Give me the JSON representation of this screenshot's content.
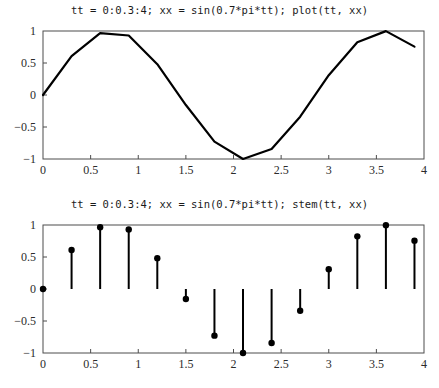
{
  "figure": {
    "background": "#ffffff",
    "line_color": "#000000",
    "axis_color": "#4d4d4d",
    "tick_label_color": "#2b2b2b"
  },
  "panels": [
    {
      "name": "line-plot",
      "title": "tt = 0:0.3:4; xx = sin(0.7*pi*tt); plot(tt, xx)"
    },
    {
      "name": "stem-plot",
      "title": "tt = 0:0.3:4; xx = sin(0.7*pi*tt); stem(tt, xx)"
    }
  ],
  "chart_data": [
    {
      "type": "line",
      "title": "tt = 0:0.3:4; xx = sin(0.7*pi*tt); plot(tt, xx)",
      "xlabel": "",
      "ylabel": "",
      "xlim": [
        0,
        4
      ],
      "ylim": [
        -1,
        1
      ],
      "xticks": [
        0,
        0.5,
        1,
        1.5,
        2,
        2.5,
        3,
        3.5,
        4
      ],
      "xtick_labels": [
        "0",
        "0.5",
        "1",
        "1.5",
        "2",
        "2.5",
        "3",
        "3.5",
        "4"
      ],
      "yticks": [
        -1,
        -0.5,
        0,
        0.5,
        1
      ],
      "ytick_labels": [
        "−1",
        "−0.5",
        "0",
        "0.5",
        "1"
      ],
      "grid": false,
      "legend": null,
      "x": [
        0,
        0.3,
        0.6,
        0.9,
        1.2,
        1.5,
        1.8,
        2.1,
        2.4,
        2.7,
        3.0,
        3.3,
        3.6,
        3.9
      ],
      "values": [
        0.0,
        0.6088,
        0.9659,
        0.9298,
        0.4818,
        -0.1564,
        -0.729,
        -1.0,
        -0.8443,
        -0.3387,
        0.309,
        0.823,
        0.998,
        0.7557
      ],
      "series": [
        {
          "name": "xx = sin(0.7*pi*tt)",
          "values": [
            0.0,
            0.6088,
            0.9659,
            0.9298,
            0.4818,
            -0.1564,
            -0.729,
            -1.0,
            -0.8443,
            -0.3387,
            0.309,
            0.823,
            0.998,
            0.7557
          ]
        }
      ]
    },
    {
      "type": "bar",
      "style": "stem",
      "title": "tt = 0:0.3:4; xx = sin(0.7*pi*tt); stem(tt, xx)",
      "xlabel": "",
      "ylabel": "",
      "xlim": [
        0,
        4
      ],
      "ylim": [
        -1,
        1
      ],
      "xticks": [
        0,
        0.5,
        1,
        1.5,
        2,
        2.5,
        3,
        3.5,
        4
      ],
      "xtick_labels": [
        "0",
        "0.5",
        "1",
        "1.5",
        "2",
        "2.5",
        "3",
        "3.5",
        "4"
      ],
      "yticks": [
        -1,
        -0.5,
        0,
        0.5,
        1
      ],
      "ytick_labels": [
        "−1",
        "−0.5",
        "0",
        "0.5",
        "1"
      ],
      "grid": false,
      "legend": null,
      "categories": [
        "0",
        "0.3",
        "0.6",
        "0.9",
        "1.2",
        "1.5",
        "1.8",
        "2.1",
        "2.4",
        "2.7",
        "3.0",
        "3.3",
        "3.6",
        "3.9"
      ],
      "x": [
        0,
        0.3,
        0.6,
        0.9,
        1.2,
        1.5,
        1.8,
        2.1,
        2.4,
        2.7,
        3.0,
        3.3,
        3.6,
        3.9
      ],
      "values": [
        0.0,
        0.6088,
        0.9659,
        0.9298,
        0.4818,
        -0.1564,
        -0.729,
        -1.0,
        -0.8443,
        -0.3387,
        0.309,
        0.823,
        0.998,
        0.7557
      ],
      "series": [
        {
          "name": "xx = sin(0.7*pi*tt)",
          "values": [
            0.0,
            0.6088,
            0.9659,
            0.9298,
            0.4818,
            -0.1564,
            -0.729,
            -1.0,
            -0.8443,
            -0.3387,
            0.309,
            0.823,
            0.998,
            0.7557
          ]
        }
      ]
    }
  ]
}
